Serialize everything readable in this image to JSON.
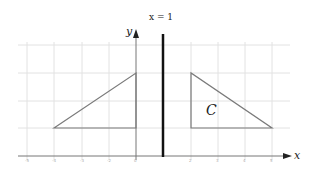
{
  "diagram": {
    "line_label": "x = 1",
    "y_axis_label": "y",
    "x_axis_label": "x",
    "shape_label": "C",
    "x_range": [
      -5,
      5
    ],
    "y_range": [
      0,
      4
    ],
    "left_triangle": [
      [
        -3,
        1
      ],
      [
        0,
        3
      ],
      [
        0,
        1
      ]
    ],
    "triangle_C": [
      [
        2,
        3
      ],
      [
        2,
        1
      ],
      [
        5,
        1
      ]
    ],
    "x_ticks": [
      "-5",
      "-4",
      "-3",
      "-2",
      "-1",
      "0",
      "1",
      "2",
      "3",
      "4",
      "5"
    ],
    "y_ticks": [
      "1",
      "2",
      "3",
      "4"
    ]
  }
}
